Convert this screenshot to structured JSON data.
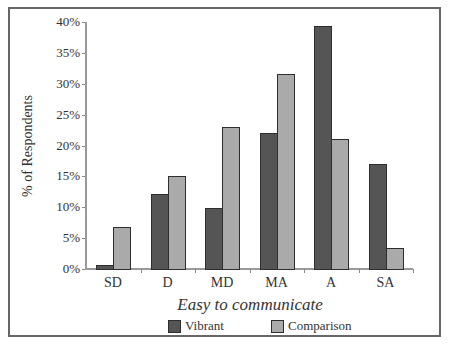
{
  "chart_data": {
    "type": "bar",
    "title": "",
    "xlabel": "Easy to communicate",
    "ylabel": "% of Respondents",
    "categories": [
      "SD",
      "D",
      "MD",
      "MA",
      "A",
      "SA"
    ],
    "series": [
      {
        "name": "Vibrant",
        "color": "#555555",
        "values": [
          0.7,
          12.1,
          9.9,
          22.0,
          39.4,
          17.0
        ]
      },
      {
        "name": "Comparison",
        "color": "#aaaaaa",
        "values": [
          6.8,
          15.1,
          23.0,
          31.5,
          21.0,
          3.4
        ]
      }
    ],
    "ylim": [
      0,
      40
    ],
    "yticks": [
      "0%",
      "5%",
      "10%",
      "15%",
      "20%",
      "25%",
      "30%",
      "35%",
      "40%"
    ],
    "grid": false,
    "legend_position": "bottom"
  }
}
